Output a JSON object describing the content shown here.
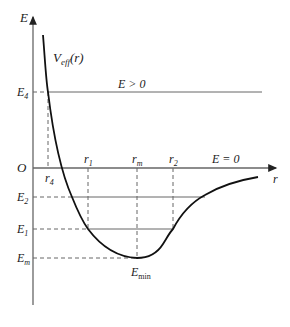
{
  "diagram": {
    "axes": {
      "y_label": "E",
      "x_label": "r",
      "origin_label": "O"
    },
    "curve_label": {
      "main": "V",
      "sub": "eff",
      "suffix": "(r)"
    },
    "energy_levels": [
      {
        "label_main": "E",
        "label_sub": "4",
        "region_label": "E > 0"
      },
      {
        "label_main": "E",
        "label_sub": "2"
      },
      {
        "label_main": "E",
        "label_sub": "1"
      },
      {
        "label_main": "E",
        "label_sub": "m"
      }
    ],
    "zero_line_label": "E = 0",
    "radial_markers": [
      {
        "main": "r",
        "sub": "4"
      },
      {
        "main": "r",
        "sub": "1"
      },
      {
        "main": "r",
        "sub": "m"
      },
      {
        "main": "r",
        "sub": "2"
      }
    ],
    "minimum_label": {
      "main": "E",
      "sub": "min"
    },
    "colors": {
      "axis": "#555555",
      "curve": "#111111",
      "lines": "#666666",
      "text": "#1a1a1a"
    }
  }
}
